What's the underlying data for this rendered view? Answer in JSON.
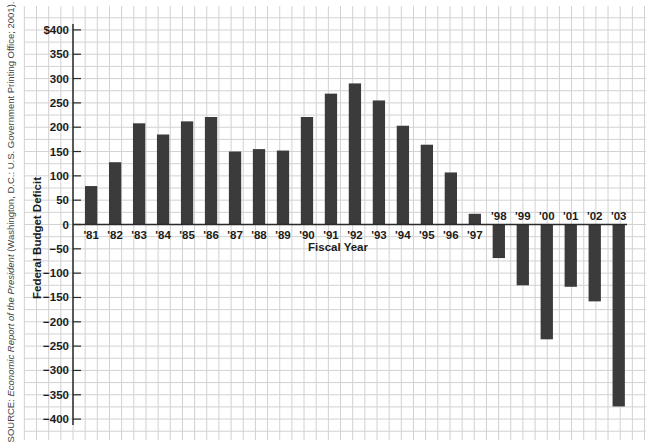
{
  "source_note": {
    "prefix": "SOURCE: ",
    "title": "Economic Report of the President",
    "suffix": " (Washington, D.C.: U.S. Government Printing Office; 2001)."
  },
  "colors": {
    "bar": "#3b3b3b",
    "grid": "#d2d2d2",
    "axis": "#2a2a2a",
    "text": "#1c1c1c",
    "background": "#ffffff"
  },
  "chart_data": {
    "type": "bar",
    "title": "",
    "xlabel": "Fiscal Year",
    "ylabel": "Federal Budget Deficit",
    "ylim": [
      -400,
      400
    ],
    "yticks": [
      400,
      350,
      300,
      250,
      200,
      150,
      100,
      50,
      0,
      -50,
      -100,
      -150,
      -200,
      -250,
      -300,
      -350,
      -400
    ],
    "ytick_labels": [
      "$400",
      "350",
      "300",
      "250",
      "200",
      "150",
      "100",
      "50",
      "0",
      "-50",
      "-100",
      "-150",
      "-200",
      "-250",
      "-300",
      "-350",
      "-400"
    ],
    "grid": true,
    "legend": null,
    "categories": [
      "'81",
      "'82",
      "'83",
      "'84",
      "'85",
      "'86",
      "'87",
      "'88",
      "'89",
      "'90",
      "'91",
      "'92",
      "'93",
      "'94",
      "'95",
      "'96",
      "'97",
      "'98",
      "'99",
      "'00",
      "'01",
      "'02",
      "'03"
    ],
    "values": [
      79,
      128,
      208,
      185,
      212,
      221,
      150,
      155,
      152,
      221,
      269,
      290,
      255,
      203,
      164,
      107,
      22,
      -69,
      -125,
      -236,
      -128,
      -158,
      -374
    ]
  }
}
